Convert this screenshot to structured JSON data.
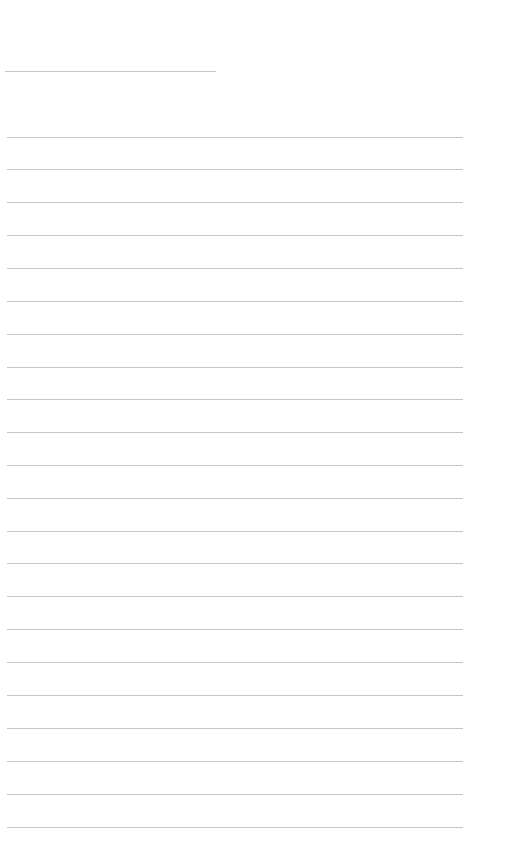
{
  "page": {
    "type": "ruled-note-page",
    "background_color": "#ffffff",
    "rule_color": "#c6c6c6",
    "header_line": {
      "y": 71,
      "x_start": 5,
      "x_end": 216
    },
    "body_lines": {
      "x_start": 7,
      "x_end": 463,
      "y_positions": [
        137,
        169,
        202,
        235,
        268,
        301,
        334,
        367,
        399,
        432,
        465,
        498,
        531,
        563,
        596,
        629,
        662,
        695,
        728,
        761,
        794,
        827
      ]
    }
  }
}
